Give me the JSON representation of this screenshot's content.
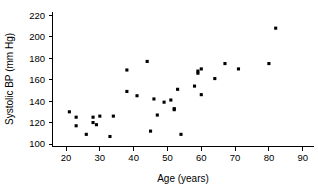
{
  "chart_data": {
    "type": "scatter",
    "title": "",
    "xlabel": "Age (years)",
    "ylabel": "Systolic BP (mm Hg)",
    "xlim": [
      15,
      92
    ],
    "ylim": [
      96,
      226
    ],
    "xticks": [
      20,
      30,
      40,
      50,
      60,
      70,
      80,
      90
    ],
    "yticks": [
      100,
      120,
      140,
      160,
      180,
      200,
      220
    ],
    "grid": false,
    "legend": null,
    "series": [
      {
        "name": "Subjects",
        "marker": "filled-square",
        "color": "#000000",
        "points": [
          {
            "x": 21,
            "y": 130
          },
          {
            "x": 23,
            "y": 125
          },
          {
            "x": 23,
            "y": 117
          },
          {
            "x": 26,
            "y": 109
          },
          {
            "x": 28,
            "y": 125
          },
          {
            "x": 28,
            "y": 120
          },
          {
            "x": 29,
            "y": 118
          },
          {
            "x": 30,
            "y": 126
          },
          {
            "x": 33,
            "y": 107
          },
          {
            "x": 34,
            "y": 126
          },
          {
            "x": 38,
            "y": 169
          },
          {
            "x": 38,
            "y": 149
          },
          {
            "x": 41,
            "y": 145
          },
          {
            "x": 44,
            "y": 177
          },
          {
            "x": 45,
            "y": 112
          },
          {
            "x": 46,
            "y": 142
          },
          {
            "x": 47,
            "y": 127
          },
          {
            "x": 49,
            "y": 139
          },
          {
            "x": 51,
            "y": 141
          },
          {
            "x": 52,
            "y": 133
          },
          {
            "x": 52,
            "y": 132
          },
          {
            "x": 53,
            "y": 151
          },
          {
            "x": 54,
            "y": 109
          },
          {
            "x": 58,
            "y": 154
          },
          {
            "x": 59,
            "y": 166
          },
          {
            "x": 59,
            "y": 168
          },
          {
            "x": 60,
            "y": 170
          },
          {
            "x": 60,
            "y": 146
          },
          {
            "x": 64,
            "y": 161
          },
          {
            "x": 67,
            "y": 175
          },
          {
            "x": 71,
            "y": 170
          },
          {
            "x": 80,
            "y": 175
          },
          {
            "x": 82,
            "y": 208
          }
        ]
      }
    ]
  },
  "axes": {
    "x_title": "Age (years)",
    "y_title": "Systolic BP (mm Hg)",
    "x_tick_labels": [
      "20",
      "30",
      "40",
      "50",
      "60",
      "70",
      "80",
      "90"
    ],
    "y_tick_labels": [
      "100",
      "120",
      "140",
      "160",
      "180",
      "200",
      "220"
    ]
  },
  "colors": {
    "marker": "#000000",
    "axis": "#000000",
    "background": "#ffffff"
  }
}
